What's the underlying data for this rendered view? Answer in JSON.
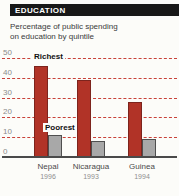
{
  "panel": {
    "title": "EDUCATION"
  },
  "subtitle": {
    "line1": "Percentage of public spending",
    "line2": "on education by quintile"
  },
  "chart_data": {
    "type": "bar",
    "title": "EDUCATION",
    "subtitle": "Percentage of public spending on education by quintile",
    "categories": [
      "Nepal",
      "Nicaragua",
      "Guinea"
    ],
    "category_years": [
      "1996",
      "1993",
      "1994"
    ],
    "series": [
      {
        "name": "Richest",
        "color": "#b13327",
        "outline": "#7c241d",
        "values": [
          46,
          39,
          28
        ]
      },
      {
        "name": "Poorest",
        "color": "#a8a8a8",
        "outline": "#4f4f4f",
        "values": [
          11,
          8,
          9
        ]
      }
    ],
    "ylim": [
      0,
      50
    ],
    "yticks": [
      0,
      10,
      20,
      30,
      40,
      50
    ],
    "grid": "horizontal-dotted-red",
    "gridline_color": "#c8423a",
    "legend_position": "inline-annotations",
    "annotations": [
      {
        "text": "Richest",
        "series": "Richest"
      },
      {
        "text": "Poorest",
        "series": "Poorest"
      }
    ]
  },
  "colors": {
    "header_bg": "#181818",
    "header_text": "#ffffff",
    "background": "#fcfcf9",
    "axis_line": "#4a4a4a",
    "tick_text": "#8b8b8b"
  }
}
